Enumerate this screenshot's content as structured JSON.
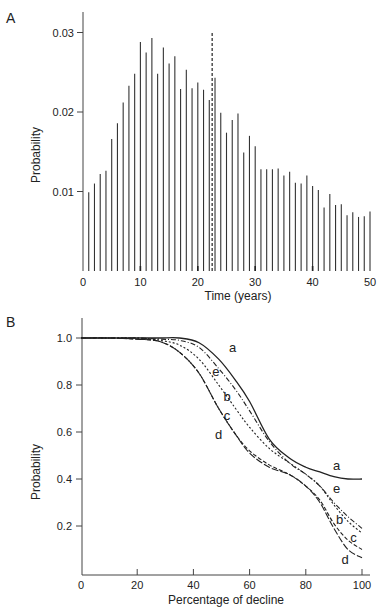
{
  "chart_data": [
    {
      "panel": "A",
      "type": "bar",
      "title": "",
      "xlabel": "Time (years)",
      "ylabel": "Probability",
      "xlim": [
        0,
        50
      ],
      "ylim": [
        0,
        0.032
      ],
      "xticks": [
        0,
        10,
        20,
        30,
        40,
        50
      ],
      "yticks": [
        0.01,
        0.02,
        0.03
      ],
      "ytick_labels": [
        "0.01",
        "0.02",
        "0.03"
      ],
      "grid": false,
      "x": [
        1,
        2,
        3,
        4,
        5,
        6,
        7,
        8,
        9,
        10,
        11,
        12,
        13,
        14,
        15,
        16,
        17,
        18,
        19,
        20,
        21,
        22,
        23,
        24,
        25,
        26,
        27,
        28,
        29,
        30,
        31,
        32,
        33,
        34,
        35,
        36,
        37,
        38,
        39,
        40,
        41,
        42,
        43,
        44,
        45,
        46,
        47,
        48,
        49,
        50
      ],
      "values": [
        0.0099,
        0.011,
        0.0122,
        0.0126,
        0.0166,
        0.0186,
        0.0212,
        0.0233,
        0.0248,
        0.0288,
        0.0275,
        0.0293,
        0.0248,
        0.0281,
        0.0261,
        0.027,
        0.0229,
        0.0253,
        0.023,
        0.0237,
        0.0228,
        0.0215,
        0.0243,
        0.0199,
        0.0174,
        0.019,
        0.0198,
        0.0149,
        0.017,
        0.0157,
        0.0128,
        0.0128,
        0.0128,
        0.0129,
        0.012,
        0.0125,
        0.0111,
        0.011,
        0.012,
        0.0107,
        0.0102,
        0.008,
        0.0097,
        0.0083,
        0.0084,
        0.007,
        0.0074,
        0.0068,
        0.0069,
        0.0075
      ],
      "annotations": [
        {
          "type": "vline",
          "style": "dashed",
          "x": 22.5,
          "y_top": 0.03
        }
      ]
    },
    {
      "panel": "B",
      "type": "line",
      "title": "",
      "xlabel": "Percentage of decline",
      "ylabel": "Probability",
      "xlim": [
        0,
        100
      ],
      "ylim": [
        0,
        1.05
      ],
      "xticks": [
        0,
        20,
        40,
        60,
        80,
        100
      ],
      "yticks": [
        0.2,
        0.4,
        0.6,
        0.8,
        1.0
      ],
      "ytick_labels": [
        "0.2",
        "0.4",
        "0.6",
        "0.8",
        "1.0"
      ],
      "grid": false,
      "x": [
        0,
        10,
        20,
        28,
        35,
        42,
        49,
        55,
        60,
        67,
        74,
        80,
        85,
        90,
        95,
        100
      ],
      "series": [
        {
          "name": "a",
          "style": "solid",
          "values": [
            1.0,
            1.0,
            1.0,
            1.0,
            1.0,
            0.98,
            0.91,
            0.82,
            0.73,
            0.57,
            0.49,
            0.45,
            0.43,
            0.41,
            0.4,
            0.4
          ]
        },
        {
          "name": "e",
          "style": "dashdot",
          "values": [
            1.0,
            1.0,
            1.0,
            0.995,
            0.99,
            0.96,
            0.87,
            0.78,
            0.69,
            0.56,
            0.47,
            0.42,
            0.37,
            0.3,
            0.24,
            0.19
          ]
        },
        {
          "name": "b",
          "style": "dotted",
          "values": [
            1.0,
            1.0,
            1.0,
            0.99,
            0.97,
            0.91,
            0.8,
            0.7,
            0.62,
            0.53,
            0.47,
            0.42,
            0.37,
            0.29,
            0.22,
            0.17
          ]
        },
        {
          "name": "c",
          "style": "dashed",
          "values": [
            1.0,
            1.0,
            0.995,
            0.985,
            0.94,
            0.85,
            0.7,
            0.59,
            0.52,
            0.46,
            0.42,
            0.37,
            0.31,
            0.21,
            0.14,
            0.1
          ]
        },
        {
          "name": "d",
          "style": "longdash",
          "values": [
            1.0,
            1.0,
            0.995,
            0.985,
            0.94,
            0.85,
            0.7,
            0.59,
            0.51,
            0.45,
            0.42,
            0.37,
            0.3,
            0.19,
            0.1,
            0.065
          ]
        }
      ],
      "curve_labels": [
        {
          "name": "a",
          "x": 54,
          "y": 0.94
        },
        {
          "name": "e",
          "x": 48,
          "y": 0.84
        },
        {
          "name": "b",
          "x": 52,
          "y": 0.73
        },
        {
          "name": "c",
          "x": 52,
          "y": 0.65
        },
        {
          "name": "d",
          "x": 49,
          "y": 0.57
        },
        {
          "name": "a",
          "x": 91,
          "y": 0.44
        },
        {
          "name": "e",
          "x": 91,
          "y": 0.34
        },
        {
          "name": "b",
          "x": 92,
          "y": 0.21
        },
        {
          "name": "c",
          "x": 97,
          "y": 0.13
        },
        {
          "name": "d",
          "x": 94,
          "y": 0.04
        }
      ]
    }
  ],
  "panels": {
    "a_label": "A",
    "b_label": "B"
  }
}
